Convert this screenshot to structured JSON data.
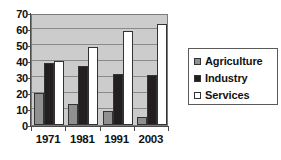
{
  "chart_data": {
    "type": "bar",
    "title": "",
    "xlabel": "",
    "ylabel": "",
    "categories": [
      "1971",
      "1981",
      "1991",
      "2003"
    ],
    "series": [
      {
        "name": "Agriculture",
        "color": "#909090",
        "values": [
          20,
          13,
          9,
          5
        ]
      },
      {
        "name": "Industry",
        "color": "#231f20",
        "values": [
          39,
          37,
          32,
          31
        ]
      },
      {
        "name": "Services",
        "color": "#ffffff",
        "values": [
          40,
          49,
          59,
          63
        ]
      }
    ],
    "ylim": [
      0,
      70
    ],
    "yticks": [
      0,
      10,
      20,
      30,
      40,
      50,
      60,
      70
    ],
    "ytick_labels": [
      "0",
      "10",
      "20",
      "30",
      "40",
      "50",
      "60",
      "70"
    ],
    "grid": true,
    "legend_position": "right",
    "plot_background": "#cccccc",
    "legend_background": "#ffffff"
  }
}
